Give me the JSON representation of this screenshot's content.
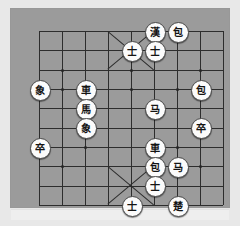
{
  "colors": {
    "page_background": "#e8e8e8",
    "board_background": "#9b9b9b",
    "line": "#2d2d2d",
    "piece_face": "#fbfbfb",
    "piece_edge": "#4a4a4a",
    "piece_text": "#141414"
  },
  "board": {
    "type": "janggi",
    "columns": 9,
    "rows": 10,
    "grid": true,
    "palaces": [
      "top",
      "bottom"
    ],
    "marked_nodes_label": "intersection-dot"
  },
  "pieces": [
    {
      "name": "han-king",
      "label": "漢",
      "col": 5,
      "row": 0,
      "side": "han"
    },
    {
      "name": "han-cannon-right",
      "label": "包",
      "col": 6,
      "row": 0,
      "side": "han"
    },
    {
      "name": "han-guard-left",
      "label": "士",
      "col": 4,
      "row": 1,
      "side": "han"
    },
    {
      "name": "han-guard-right",
      "label": "士",
      "col": 5,
      "row": 1,
      "side": "han"
    },
    {
      "name": "elephant-a3",
      "label": "象",
      "col": 0,
      "row": 3,
      "side": "cho"
    },
    {
      "name": "chariot-c3",
      "label": "車",
      "col": 2,
      "row": 3,
      "side": "cho"
    },
    {
      "name": "cannon-h3",
      "label": "包",
      "col": 7,
      "row": 3,
      "side": "han"
    },
    {
      "name": "horse-c4",
      "label": "馬",
      "col": 2,
      "row": 4,
      "side": "cho"
    },
    {
      "name": "horse-f4",
      "label": "马",
      "col": 5,
      "row": 4,
      "side": "han"
    },
    {
      "name": "elephant-c5",
      "label": "象",
      "col": 2,
      "row": 5,
      "side": "cho"
    },
    {
      "name": "soldier-h5",
      "label": "卒",
      "col": 7,
      "row": 5,
      "side": "cho"
    },
    {
      "name": "soldier-a6",
      "label": "卒",
      "col": 0,
      "row": 6,
      "side": "cho"
    },
    {
      "name": "chariot-f6",
      "label": "車",
      "col": 5,
      "row": 6,
      "side": "cho"
    },
    {
      "name": "cannon-f7",
      "label": "包",
      "col": 5,
      "row": 7,
      "side": "cho"
    },
    {
      "name": "horse-g7",
      "label": "马",
      "col": 6,
      "row": 7,
      "side": "han"
    },
    {
      "name": "cho-guard-mid",
      "label": "士",
      "col": 5,
      "row": 8,
      "side": "cho"
    },
    {
      "name": "cho-guard-left",
      "label": "士",
      "col": 4,
      "row": 9,
      "side": "cho"
    },
    {
      "name": "cho-king",
      "label": "楚",
      "col": 6,
      "row": 9,
      "side": "cho"
    }
  ],
  "node_dots": [
    {
      "col": 1,
      "row": 2
    },
    {
      "col": 4,
      "row": 2
    },
    {
      "col": 7,
      "row": 2
    },
    {
      "col": 1,
      "row": 3
    },
    {
      "col": 4,
      "row": 3
    },
    {
      "col": 6,
      "row": 3
    },
    {
      "col": 2,
      "row": 6
    },
    {
      "col": 6,
      "row": 6
    },
    {
      "col": 1,
      "row": 7
    },
    {
      "col": 7,
      "row": 7
    }
  ]
}
